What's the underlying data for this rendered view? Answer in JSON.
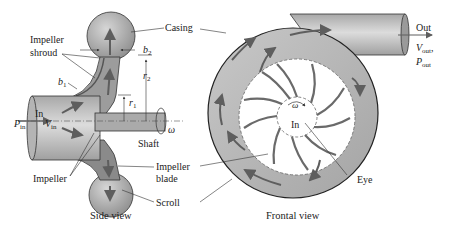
{
  "diagram": {
    "colors": {
      "casing_fill": "#b8b8b8",
      "casing_dark": "#8a8a8a",
      "pipe_fill": "#c4c4c4",
      "arrow": "#5e5e5e",
      "blade": "#6a6a6a",
      "outline": "#2a2a2a"
    },
    "side_view": {
      "caption": "Side view",
      "labels": {
        "casing": "Casing",
        "impeller_shroud_line1": "Impeller",
        "impeller_shroud_line2": "shroud",
        "b1": "b",
        "b1_sub": "1",
        "b2": "b",
        "b2_sub": "2",
        "r1": "r",
        "r1_sub": "1",
        "r2": "r",
        "r2_sub": "2",
        "in": "In",
        "p_in": "P",
        "p_in_sub": "in",
        "v_in": "V",
        "v_in_sub": "in",
        "omega": "ω",
        "shaft": "Shaft",
        "impeller": "Impeller",
        "impeller_blade_line1": "Impeller",
        "impeller_blade_line2": "blade",
        "scroll": "Scroll"
      }
    },
    "frontal_view": {
      "caption": "Frontal view",
      "labels": {
        "out": "Out",
        "v_out": "V",
        "v_out_sub": "out",
        "comma": ",",
        "p_out": "P",
        "p_out_sub": "out",
        "omega": "ω",
        "in": "In",
        "eye": "Eye"
      },
      "blade_count": 10
    }
  }
}
